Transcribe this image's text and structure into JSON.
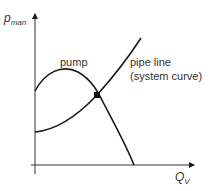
{
  "diagram": {
    "y_axis": {
      "label_main": "p",
      "label_sub": "man"
    },
    "x_axis": {
      "label_main": "Q",
      "label_sub": "V"
    },
    "curves": [
      {
        "name": "pump",
        "label_lines": [
          "pump"
        ]
      },
      {
        "name": "pipe-line",
        "label_lines": [
          "pipe line",
          "(system curve)"
        ]
      }
    ],
    "operating_point": {
      "label": ""
    },
    "colors": {
      "line": "#1a1a1a",
      "text": "#333333"
    }
  }
}
